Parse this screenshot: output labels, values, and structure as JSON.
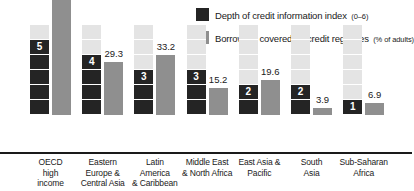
{
  "legend": {
    "items": [
      {
        "icon": "legend-swatch-dark",
        "color": "#242424",
        "label": "Depth of credit information index",
        "sub": "(0–6)"
      },
      {
        "icon": "legend-swatch-gray",
        "color": "#8f8f8f",
        "label": "Borrowers covered by credit registries",
        "sub": "(% of adults)"
      }
    ]
  },
  "chart_data": {
    "type": "bar",
    "title": "",
    "xlabel": "",
    "ylabel": "",
    "grid": false,
    "legend_position": "top-right",
    "index_max": 6,
    "categories": [
      "OECD high income",
      "Eastern Europe & Central Asia",
      "Latin America & Caribbean",
      "Middle East & North Africa",
      "East Asia & Pacific",
      "South Asia",
      "Sub-Saharan Africa"
    ],
    "category_lines": [
      [
        "OECD",
        "high",
        "income"
      ],
      [
        "Eastern",
        "Europe &",
        "Central Asia"
      ],
      [
        "Latin",
        "America",
        "& Caribbean"
      ],
      [
        "Middle East",
        "& North Africa"
      ],
      [
        "East Asia &",
        "Pacific"
      ],
      [
        "South",
        "Asia"
      ],
      [
        "Sub-Saharan",
        "Africa"
      ]
    ],
    "series": [
      {
        "name": "Depth of credit information index (0–6)",
        "color": "#242424",
        "values": [
          5,
          4,
          3,
          3,
          2,
          2,
          1
        ],
        "value_labels": [
          "5",
          "4",
          "3",
          "3",
          "2",
          "2",
          "1"
        ]
      },
      {
        "name": "Borrowers covered by credit registries (% of adults)",
        "color": "#8f8f8f",
        "values": [
          64.0,
          29.3,
          33.2,
          15.2,
          19.6,
          3.9,
          6.9
        ],
        "value_labels": [
          "64.0",
          "29.3",
          "33.2",
          "15.2",
          "19.6",
          "3.9",
          "6.9"
        ]
      }
    ],
    "ylim": [
      0,
      70
    ]
  }
}
